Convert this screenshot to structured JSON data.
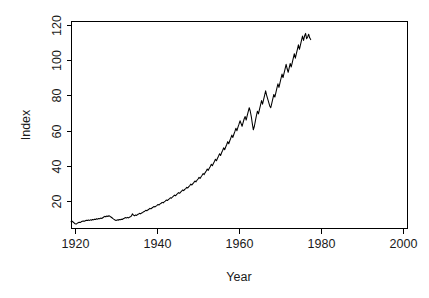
{
  "chart_data": {
    "type": "line",
    "title": "",
    "subtitle": "",
    "xlabel": "Year",
    "ylabel": "Index",
    "xlim": [
      1919,
      2001
    ],
    "ylim": [
      5,
      122
    ],
    "xticks": [
      1920,
      1940,
      1960,
      1980,
      2000
    ],
    "yticks": [
      20,
      40,
      60,
      80,
      100,
      120
    ],
    "xtick_labels": [
      "1920",
      "1940",
      "1960",
      "1980",
      "2000"
    ],
    "ytick_labels": [
      "20",
      "40",
      "60",
      "80",
      "100",
      "120"
    ],
    "grid": false,
    "legend": null,
    "legend_position": "none",
    "line_color": "#000000",
    "background_color": "#ffffff",
    "axis_color": "#000000",
    "series": [
      {
        "name": "Index",
        "x_start": 1919.0,
        "x_step": 0.25,
        "values": [
          8.6,
          8.9,
          8.4,
          7.9,
          7.4,
          7.2,
          7.6,
          8.0,
          8.3,
          8.1,
          8.5,
          8.8,
          9.0,
          8.8,
          9.1,
          9.4,
          9.2,
          9.5,
          9.3,
          9.6,
          9.4,
          9.8,
          9.6,
          10.0,
          9.8,
          10.2,
          10.0,
          10.4,
          10.2,
          10.6,
          10.4,
          10.8,
          11.2,
          11.6,
          11.3,
          11.8,
          11.5,
          11.9,
          11.6,
          11.2,
          10.8,
          10.3,
          9.9,
          9.5,
          9.2,
          9.6,
          9.4,
          9.8,
          9.6,
          10.0,
          9.8,
          10.2,
          10.5,
          10.9,
          10.6,
          11.0,
          10.7,
          11.1,
          11.4,
          11.8,
          13.0,
          12.3,
          11.9,
          12.4,
          12.1,
          12.6,
          12.9,
          13.3,
          13.0,
          13.5,
          13.8,
          14.2,
          14.5,
          15.0,
          14.7,
          15.2,
          15.6,
          16.1,
          15.8,
          16.3,
          16.7,
          17.2,
          16.9,
          17.4,
          17.8,
          18.3,
          18.0,
          18.6,
          19.0,
          19.5,
          19.2,
          19.8,
          20.2,
          20.8,
          20.5,
          21.1,
          21.5,
          22.1,
          21.8,
          22.5,
          23.0,
          23.6,
          23.2,
          23.9,
          24.4,
          25.0,
          24.6,
          25.3,
          25.8,
          26.5,
          26.1,
          26.8,
          27.3,
          28.0,
          27.6,
          28.4,
          29.0,
          29.8,
          29.3,
          30.1,
          30.8,
          31.6,
          31.1,
          32.0,
          32.7,
          33.6,
          33.0,
          34.0,
          34.8,
          35.8,
          35.2,
          36.3,
          37.2,
          38.3,
          37.6,
          38.8,
          39.8,
          41.0,
          40.2,
          41.5,
          42.6,
          43.9,
          43.0,
          44.4,
          45.6,
          47.0,
          46.0,
          47.5,
          48.8,
          50.3,
          49.2,
          50.8,
          52.2,
          53.8,
          52.6,
          54.3,
          55.8,
          57.5,
          56.2,
          58.0,
          59.6,
          61.4,
          60.0,
          62.0,
          63.7,
          65.6,
          64.1,
          62.5,
          64.6,
          66.6,
          68.0,
          66.0,
          68.5,
          70.8,
          73.0,
          71.0,
          68.0,
          64.0,
          60.5,
          62.5,
          65.5,
          68.5,
          71.0,
          69.5,
          72.0,
          74.5,
          77.0,
          75.0,
          77.5,
          80.0,
          82.5,
          80.0,
          78.0,
          76.0,
          74.0,
          73.0,
          75.5,
          78.0,
          80.5,
          79.0,
          81.5,
          84.0,
          86.5,
          84.5,
          87.0,
          89.5,
          92.0,
          90.0,
          92.5,
          95.0,
          97.5,
          95.0,
          93.0,
          95.5,
          98.0,
          96.0,
          98.5,
          101.0,
          103.5,
          101.0,
          103.5,
          106.0,
          108.5,
          106.0,
          108.5,
          111.0,
          113.5,
          111.0,
          113.5,
          115.0,
          112.0,
          113.0,
          114.5,
          112.5,
          111.5
        ]
      }
    ]
  },
  "figure": {
    "plot_area": {
      "left": 71,
      "top": 21,
      "right": 407,
      "bottom": 228
    },
    "tick_length": 5
  }
}
